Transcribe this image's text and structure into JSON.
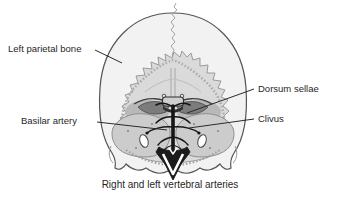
{
  "labels": {
    "left_parietal_bone": "Left parietal bone",
    "dorsum_sellae": "Dorsum sellae",
    "clivus": "Clivus",
    "basilar_artery": "Basilar artery",
    "caption": "Right and left vertebral arteries"
  },
  "palette": {
    "background": "#ffffff",
    "bone_fill": "#f2f2f2",
    "opening_fill": "#dadada",
    "tentorium_shadow": "#7c7c7c",
    "hemisphere_fill": "#cccccc",
    "vessel_black": "#161616",
    "outline": "#555555",
    "leader_line": "#2b2b2b",
    "label_text": "#1f1f1f"
  }
}
